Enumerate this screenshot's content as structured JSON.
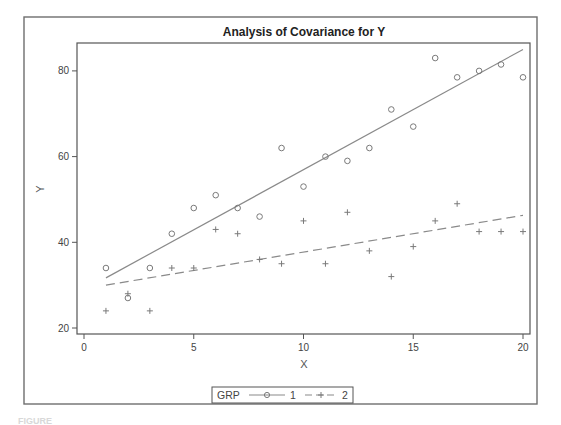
{
  "chart_data": {
    "type": "scatter",
    "title": "Analysis of Covariance for Y",
    "xlabel": "X",
    "ylabel": "Y",
    "xlim": [
      0,
      20
    ],
    "ylim": [
      20,
      85
    ],
    "xticks": [
      0,
      5,
      10,
      15,
      20
    ],
    "yticks": [
      20,
      40,
      60,
      80
    ],
    "grid": false,
    "legend": {
      "title": "GRP",
      "placement": "bottom-center",
      "entries": [
        {
          "label": "1",
          "marker": "circle",
          "line": "solid"
        },
        {
          "label": "2",
          "marker": "plus",
          "line": "dashed"
        }
      ]
    },
    "series": [
      {
        "name": "1",
        "marker": "circle",
        "x": [
          1,
          2,
          3,
          4,
          5,
          6,
          7,
          8,
          9,
          10,
          11,
          12,
          13,
          14,
          15,
          16,
          17,
          18,
          19,
          20
        ],
        "y": [
          34,
          27,
          34,
          42,
          48,
          51,
          48,
          46,
          62,
          53,
          60,
          59,
          62,
          71,
          67,
          83,
          78.5,
          80,
          81.5,
          78.5
        ],
        "fit": {
          "x": [
            1,
            20
          ],
          "y": [
            31.7,
            85
          ],
          "style": "solid"
        }
      },
      {
        "name": "2",
        "marker": "plus",
        "x": [
          1,
          2,
          3,
          4,
          5,
          6,
          7,
          8,
          9,
          10,
          11,
          12,
          13,
          14,
          15,
          16,
          17,
          18,
          19,
          20
        ],
        "y": [
          24,
          28,
          24,
          34,
          34,
          43,
          42,
          36,
          35,
          45,
          35,
          47,
          38,
          32,
          39,
          45,
          49,
          42.5,
          42.5,
          42.5
        ],
        "fit": {
          "x": [
            1,
            20
          ],
          "y": [
            30,
            46.3
          ],
          "style": "dashed"
        }
      }
    ]
  },
  "footer_text": "FIGURE"
}
